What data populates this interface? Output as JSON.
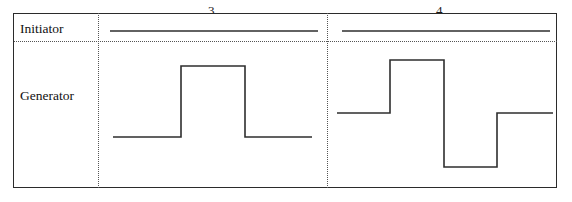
{
  "figure": {
    "type": "timing-diagram",
    "width": 572,
    "height": 202,
    "background_color": "#ffffff",
    "trace_color": "#2e2e2e",
    "frame_color": "#2b2b2b",
    "divider_color": "#555555"
  },
  "panels": [
    {
      "id": "panel-3",
      "number_label": "3.",
      "number_x": 208,
      "number_y": 4
    },
    {
      "id": "panel-4",
      "number_label": "4.",
      "number_x": 436,
      "number_y": 4
    }
  ],
  "rows": [
    {
      "id": "row-initiator",
      "label": "Initiator",
      "label_x": 20,
      "label_y": 22
    },
    {
      "id": "row-generator",
      "label": "Generator",
      "label_x": 20,
      "label_y": 89
    }
  ],
  "frame": {
    "x": 13,
    "y": 13,
    "width": 544,
    "height": 175
  },
  "dividers": {
    "vertical": [
      {
        "id": "divider-label-column",
        "x": 98,
        "y": 13,
        "height": 175
      },
      {
        "id": "divider-panel-3-4",
        "x": 327,
        "y": 13,
        "height": 175
      }
    ],
    "horizontal": [
      {
        "id": "divider-initiator-generator",
        "x": 14,
        "y": 41,
        "width": 543
      }
    ]
  },
  "chart_data": {
    "type": "line",
    "title": "",
    "xlabel": "",
    "ylabel": "",
    "grid": false,
    "legend": "none",
    "series": [
      {
        "name": "Initiator (panel 3)",
        "row": "Initiator",
        "panel": "3.",
        "style": "constant-high",
        "points": [
          [
            110,
            31
          ],
          [
            318,
            31
          ]
        ]
      },
      {
        "name": "Initiator (panel 4)",
        "row": "Initiator",
        "panel": "4.",
        "style": "constant-high",
        "points": [
          [
            342,
            31
          ],
          [
            550,
            31
          ]
        ]
      },
      {
        "name": "Generator (panel 3)",
        "row": "Generator",
        "panel": "3.",
        "style": "single-positive-pulse",
        "levels": {
          "low": 137,
          "high": 66
        },
        "points": [
          [
            113,
            137
          ],
          [
            181,
            137
          ],
          [
            181,
            66
          ],
          [
            245,
            66
          ],
          [
            245,
            137
          ],
          [
            312,
            137
          ]
        ]
      },
      {
        "name": "Generator (panel 4)",
        "row": "Generator",
        "panel": "4.",
        "style": "positive-then-negative-pulse",
        "levels": {
          "mid": 113,
          "high": 60,
          "low": 167
        },
        "points": [
          [
            337,
            113
          ],
          [
            390,
            113
          ],
          [
            390,
            60
          ],
          [
            444,
            60
          ],
          [
            444,
            167
          ],
          [
            497,
            167
          ],
          [
            497,
            113
          ],
          [
            553,
            113
          ]
        ]
      }
    ]
  }
}
